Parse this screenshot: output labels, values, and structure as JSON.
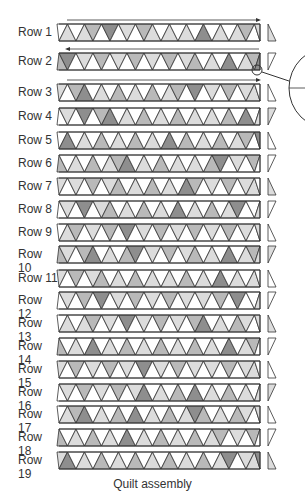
{
  "title": "Quilt assembly",
  "colors": {
    "white": "#ffffff",
    "light": "#dcdcdc",
    "medium": "#b9b9b9",
    "dark": "#8e8e8e",
    "outline": "#333333"
  },
  "rows": [
    {
      "label": "Row 1",
      "y": 24,
      "shades": "wlwlmwdwlwmlwlwlwdwlwlm"
    },
    {
      "label": "Row 2",
      "y": 53,
      "shades": "mdwlwmwlwmwlwmwlmwlwdwl"
    },
    {
      "label": "Row 3",
      "y": 84,
      "shades": "lwmdwlwmwlwmwlmwdwlwmwl"
    },
    {
      "label": "Row 4",
      "y": 108,
      "shades": "wlwdwmdwlwmwlwmwlwlwmwd"
    },
    {
      "label": "Row 5",
      "y": 132,
      "shades": "wdwlwmwlwmwlwdwmwlwmwlm"
    },
    {
      "label": "Row 6",
      "y": 155,
      "shades": "mwlwmwlmdwlwmwlwlwmdwlw"
    },
    {
      "label": "Row 7",
      "y": 178,
      "shades": "lwlwmwlmwlwmwlwdmwlwmwl"
    },
    {
      "label": "Row 8",
      "y": 201,
      "shades": "wlwdwlmwlwmwlwdwlwmwldw"
    },
    {
      "label": "Row 9",
      "y": 224,
      "shades": "wlmwlwmwdwlwmwlwmwlwmwl"
    },
    {
      "label": "Row 10",
      "y": 246,
      "shades": "mlwmdwlwmdwlwmwlmwlwdwl"
    },
    {
      "label": "Row 11",
      "y": 270,
      "shades": "lwmwlmwlwmwlwlwmwlwdwlw"
    },
    {
      "label": "Row 12",
      "y": 292,
      "shades": "wlwmwdwlwmwlwmwlwlwmwdw"
    },
    {
      "label": "Row 13",
      "y": 315,
      "shades": "wlwlmwlwdwlwmwlwmdwlwml"
    },
    {
      "label": "Row 14",
      "y": 338,
      "shades": "mwlwdwlwmwlwmwlwmwlwdwl"
    },
    {
      "label": "Row 15",
      "y": 361,
      "shades": "lwmwlwmwlwdwlwmwlwlwmwl"
    },
    {
      "label": "Row 16",
      "y": 384,
      "shades": "wlwmwlwmwldwlwmwdwlwmwl"
    },
    {
      "label": "Row 17",
      "y": 406,
      "shades": "wlmdwlwmwdwlwmwldmwlwml"
    },
    {
      "label": "Row 18",
      "y": 429,
      "shades": "mwlwmwlwdwlwmwlwmwlmwlw"
    },
    {
      "label": "Row 19",
      "y": 452,
      "shades": "ldwlwmwlwmwlwmwlwmwldwl"
    }
  ],
  "arrows": [
    {
      "row": 0,
      "direction": "right"
    },
    {
      "row": 1,
      "direction": "left"
    },
    {
      "row": 2,
      "direction": "right"
    }
  ]
}
